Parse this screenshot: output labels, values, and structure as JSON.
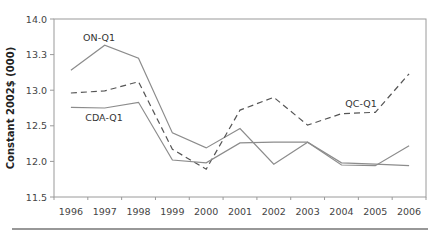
{
  "chart_data": {
    "type": "line",
    "title": "",
    "xlabel": "",
    "ylabel": "Constant 2002$ (000)",
    "categories": [
      "1996",
      "1997",
      "1998",
      "1999",
      "2000",
      "2001",
      "2002",
      "2003",
      "2004",
      "2005",
      "2006"
    ],
    "ylim": [
      11.5,
      14.0
    ],
    "yticks": [
      11.5,
      12.0,
      12.5,
      13.0,
      13.5,
      14.0
    ],
    "ytick_labels": [
      "11.5",
      "12.0",
      "12.5",
      "13.0",
      "13.3",
      "14.0"
    ],
    "grid": false,
    "legend": "inline-labels",
    "series": [
      {
        "name": "ON-Q1",
        "style": "solid",
        "color": "#8c8c8c",
        "values": [
          13.28,
          13.63,
          13.45,
          12.4,
          12.19,
          12.46,
          11.96,
          12.27,
          11.95,
          11.94,
          12.22
        ]
      },
      {
        "name": "QC-Q1",
        "style": "dashed",
        "color": "#555555",
        "values": [
          12.96,
          12.99,
          13.12,
          12.17,
          11.89,
          12.72,
          12.9,
          12.51,
          12.67,
          12.69,
          13.23
        ]
      },
      {
        "name": "CDA-Q1",
        "style": "solid",
        "color": "#8c8c8c",
        "values": [
          12.76,
          12.75,
          12.83,
          12.02,
          11.98,
          12.26,
          12.27,
          12.27,
          11.98,
          11.96,
          11.94
        ]
      }
    ],
    "annotations": [
      {
        "text": "ON-Q1",
        "series": "ON-Q1",
        "near_category": "1997",
        "position": "above"
      },
      {
        "text": "CDA-Q1",
        "series": "CDA-Q1",
        "near_category": "1997",
        "position": "below"
      },
      {
        "text": "QC-Q1",
        "series": "QC-Q1",
        "near_category": "2005",
        "position": "above"
      }
    ]
  }
}
